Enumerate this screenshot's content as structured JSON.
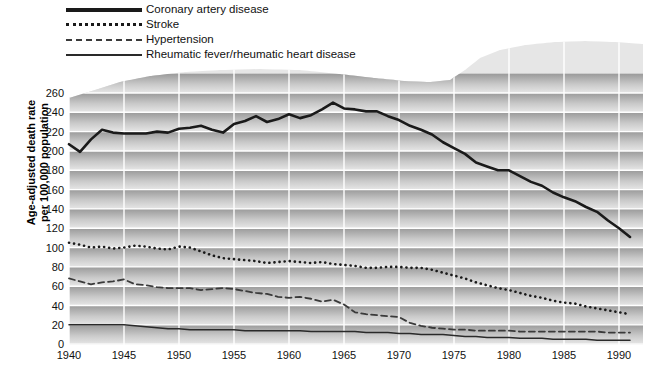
{
  "chart_data": {
    "type": "line",
    "title": "",
    "xlabel": "",
    "ylabel": "Age-adjusted death rate per 100,000 population",
    "ylabel_line1": "Age-adjusted death rate",
    "ylabel_line2": "per 100,000 population",
    "xlim": [
      1940,
      1991
    ],
    "ylim": [
      0,
      260
    ],
    "ytick_step": 20,
    "xtick_step": 5,
    "grid": true,
    "legend_position": "top-left",
    "yticks": [
      0,
      20,
      40,
      60,
      80,
      100,
      120,
      140,
      160,
      180,
      200,
      220,
      240,
      260
    ],
    "xticks": [
      1940,
      1945,
      1950,
      1955,
      1960,
      1965,
      1970,
      1975,
      1980,
      1985,
      1990
    ],
    "x": [
      1940,
      1941,
      1942,
      1943,
      1944,
      1945,
      1946,
      1947,
      1948,
      1949,
      1950,
      1951,
      1952,
      1953,
      1954,
      1955,
      1956,
      1957,
      1958,
      1959,
      1960,
      1961,
      1962,
      1963,
      1964,
      1965,
      1966,
      1967,
      1968,
      1969,
      1970,
      1971,
      1972,
      1973,
      1974,
      1975,
      1976,
      1977,
      1978,
      1979,
      1980,
      1981,
      1982,
      1983,
      1984,
      1985,
      1986,
      1987,
      1988,
      1989,
      1990,
      1991
    ],
    "series": [
      {
        "name": "Coronary artery disease",
        "style": "solid-thick",
        "color": "#1a1a1a",
        "values": [
          207,
          199,
          212,
          222,
          219,
          218,
          218,
          218,
          220,
          219,
          223,
          224,
          226,
          222,
          219,
          228,
          231,
          236,
          230,
          233,
          238,
          234,
          237,
          243,
          250,
          244,
          243,
          241,
          241,
          236,
          232,
          226,
          222,
          217,
          209,
          203,
          197,
          188,
          184,
          180,
          180,
          174,
          168,
          164,
          157,
          152,
          148,
          142,
          137,
          128,
          120,
          111
        ]
      },
      {
        "name": "Stroke",
        "style": "dotted",
        "color": "#1a1a1a",
        "values": [
          105,
          103,
          100,
          101,
          99,
          100,
          102,
          101,
          99,
          98,
          101,
          100,
          96,
          92,
          89,
          88,
          87,
          86,
          84,
          85,
          86,
          85,
          84,
          85,
          83,
          82,
          81,
          79,
          79,
          80,
          80,
          79,
          79,
          77,
          74,
          71,
          68,
          64,
          61,
          58,
          56,
          53,
          50,
          48,
          45,
          43,
          42,
          39,
          37,
          35,
          33,
          31
        ]
      },
      {
        "name": "Hypertension",
        "style": "dashed",
        "color": "#3a3a3a",
        "values": [
          68,
          65,
          62,
          64,
          65,
          67,
          62,
          61,
          59,
          58,
          58,
          58,
          56,
          57,
          58,
          57,
          55,
          53,
          52,
          49,
          48,
          49,
          47,
          44,
          46,
          41,
          33,
          31,
          30,
          29,
          28,
          22,
          19,
          17,
          16,
          15,
          15,
          14,
          14,
          14,
          14,
          13,
          13,
          13,
          13,
          13,
          13,
          13,
          13,
          12,
          12,
          12
        ]
      },
      {
        "name": "Rheumatic fever/rheumatic heart disease",
        "style": "solid-thin",
        "color": "#2a2a2a",
        "values": [
          20,
          20,
          20,
          20,
          20,
          20,
          19,
          18,
          17,
          16,
          16,
          15,
          15,
          15,
          15,
          15,
          14,
          14,
          14,
          14,
          14,
          14,
          13,
          13,
          13,
          13,
          13,
          12,
          12,
          12,
          11,
          11,
          10,
          10,
          10,
          9,
          8,
          8,
          7,
          7,
          7,
          6,
          6,
          6,
          5,
          5,
          5,
          5,
          4,
          4,
          4,
          4
        ]
      }
    ],
    "legend": [
      {
        "label": "Coronary artery disease",
        "style": "solid-thick"
      },
      {
        "label": "Stroke",
        "style": "dotted"
      },
      {
        "label": "Hypertension",
        "style": "dashed"
      },
      {
        "label": "Rheumatic fever/rheumatic heart disease",
        "style": "solid-thin"
      }
    ],
    "colors": {
      "band_dark": "#9d9d9d",
      "band_light": "#e3e3e3",
      "gridline": "#ffffff",
      "text": "#111111"
    }
  }
}
